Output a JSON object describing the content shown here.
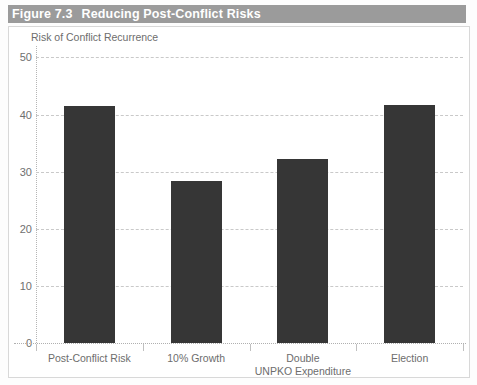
{
  "figure": {
    "number": "Figure 7.3",
    "title": "Reducing Post-Conflict Risks"
  },
  "chart_data": {
    "type": "bar",
    "title": "Reducing Post-Conflict Risks",
    "ylabel": "Risk of Conflict Recurrence",
    "xlabel": "",
    "categories": [
      "Post-Conflict Risk",
      "10% Growth",
      "Double\nUNPKO Expenditure",
      "Election"
    ],
    "values": [
      41.5,
      28.3,
      32.2,
      41.6
    ],
    "ylim": [
      0,
      52
    ],
    "yticks": [
      0,
      10,
      20,
      30,
      40,
      50
    ],
    "ytick_labels": [
      "0",
      "10",
      "20",
      "30",
      "40",
      "50"
    ],
    "grid": true,
    "legend": "none",
    "bar_color": "#363636",
    "grid_color": "#c9c9c9",
    "axis_text_color": "#6d6d6d",
    "title_bar_color": "#9b9b9b",
    "title_text_color": "#ffffff"
  }
}
